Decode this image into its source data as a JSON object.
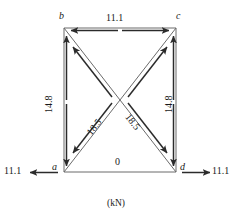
{
  "figure": {
    "caption": "(kN)",
    "units": "kN",
    "line_color": "#3a3a3a",
    "text_color": "#1a1a1a"
  },
  "nodes": {
    "a": "a",
    "b": "b",
    "c": "c",
    "d": "d"
  },
  "members": {
    "bc_top": "11.1",
    "ab_left": "14.8",
    "cd_right": "14.8",
    "ad_bottom": "0",
    "diag_ac": "18.5",
    "diag_bd": "18.5"
  },
  "reactions": {
    "left": "11.1",
    "right": "11.1"
  }
}
